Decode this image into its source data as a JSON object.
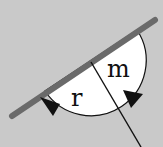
{
  "diagram": {
    "labels": {
      "r": "r",
      "m": "m"
    },
    "colors": {
      "background": "#c9c9c9",
      "mirror": "#6a6a6a",
      "arc_fill": "#ffffff",
      "stroke": "#111111"
    }
  }
}
